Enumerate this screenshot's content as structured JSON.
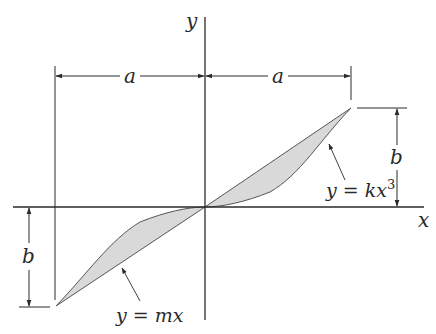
{
  "figure": {
    "type": "area-between-curves-diagram",
    "axes": {
      "x_label": "x",
      "y_label": "y"
    },
    "dimensions": {
      "horizontal_left": "a",
      "horizontal_right": "a",
      "vertical_right": "b",
      "vertical_left": "b"
    },
    "curves": {
      "line": {
        "label": "y = mx"
      },
      "cubic": {
        "label_base": "y = kx",
        "label_exponent": "3"
      }
    },
    "colors": {
      "stroke": "#2a2a2a",
      "shaded_region": "#d9d9d9",
      "background": "#ffffff"
    }
  }
}
